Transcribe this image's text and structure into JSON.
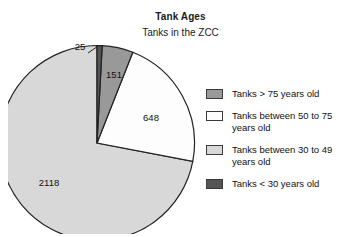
{
  "chart_data": {
    "type": "pie",
    "title": "Tank Ages",
    "subtitle": "Tanks in the ZCC",
    "xlabel": "",
    "ylabel": "",
    "legend_position": "right",
    "grid": false,
    "total": 2942,
    "categories": [
      "Tanks > 75 years old",
      "Tanks between 50 to 75 years old",
      "Tanks between 30 to 49 years old",
      "Tanks < 30 years old"
    ],
    "values": [
      151,
      648,
      2118,
      25
    ],
    "slices": [
      {
        "label": "Tanks < 30 years old",
        "value": 25,
        "value_text": "25",
        "color": "#555555",
        "start_angle_deg": 0,
        "sweep_deg": 3.06,
        "callout": true
      },
      {
        "label": "Tanks > 75 years old",
        "value": 151,
        "value_text": "151",
        "color": "#999999",
        "start_angle_deg": 3.06,
        "sweep_deg": 18.48,
        "callout": false
      },
      {
        "label": "Tanks between 50 to 75 years old",
        "value": 648,
        "value_text": "648",
        "color": "#fdfdfd",
        "start_angle_deg": 21.54,
        "sweep_deg": 79.3,
        "callout": false
      },
      {
        "label": "Tanks between 30 to 49 years old",
        "value": 2118,
        "value_text": "2118",
        "color": "#d8d8d8",
        "start_angle_deg": 100.84,
        "sweep_deg": 259.16,
        "callout": false
      }
    ]
  },
  "titles": {
    "main": "Tank Ages",
    "sub": "Tanks in the ZCC"
  },
  "pie_labels": {
    "v25": "25",
    "v151": "151",
    "v648": "648",
    "v2118": "2118"
  },
  "legend": {
    "items": [
      {
        "label": "Tanks > 75 years old",
        "color": "#999999",
        "icon": "legend-swatch-icon"
      },
      {
        "label": "Tanks between 50 to 75\nyears old",
        "color": "#fdfdfd",
        "icon": "legend-swatch-icon"
      },
      {
        "label": "Tanks between 30 to 49\nyears old",
        "color": "#d8d8d8",
        "icon": "legend-swatch-icon"
      },
      {
        "label": "Tanks < 30 years old",
        "color": "#555555",
        "icon": "legend-swatch-icon"
      }
    ]
  },
  "colors": {
    "stroke": "#222222",
    "text": "#111111",
    "background": "#ffffff"
  }
}
